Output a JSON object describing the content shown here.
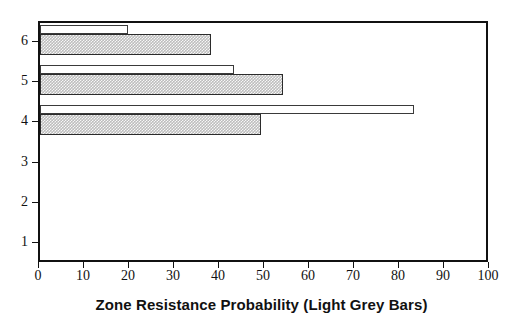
{
  "chart_data": {
    "type": "bar",
    "orientation": "horizontal",
    "title": "",
    "xlabel": "Zone Resistance Probability (Light Grey Bars)",
    "ylabel": "",
    "categories": [
      "1",
      "2",
      "3",
      "4",
      "5",
      "6"
    ],
    "xlim": [
      0,
      100
    ],
    "ylim": [
      0.5,
      6.5
    ],
    "xticks": [
      0,
      10,
      20,
      30,
      40,
      50,
      60,
      70,
      80,
      90,
      100
    ],
    "xticklabels": [
      "0",
      "10",
      "20",
      "30",
      "40",
      "50",
      "60",
      "70",
      "80",
      "90",
      "100"
    ],
    "yticks": [
      1,
      2,
      3,
      4,
      5,
      6
    ],
    "yticklabels": [
      "1",
      "2",
      "3",
      "4",
      "5",
      "6"
    ],
    "grid": false,
    "legend": false,
    "series": [
      {
        "name": "Light Grey Bars",
        "style": "light-grey-hatched",
        "color": "#bdbdbd",
        "values": [
          0,
          0,
          0,
          49,
          54,
          38
        ]
      },
      {
        "name": "White Bars",
        "style": "white-outline",
        "color": "#ffffff",
        "values": [
          0,
          0,
          0,
          83,
          43,
          19.5
        ]
      }
    ],
    "annotations": []
  },
  "axis": {
    "x_title": "Zone Resistance Probability (Light Grey Bars)"
  },
  "colors": {
    "frame": "#111111",
    "grey_bar": "#bdbdbd",
    "white_bar": "#ffffff",
    "text": "#111111"
  }
}
